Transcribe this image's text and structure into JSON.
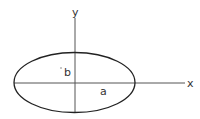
{
  "diagram": {
    "type": "ellipse-axes",
    "axes": {
      "x_label": "x",
      "y_label": "y"
    },
    "ellipse": {
      "semi_major_label": "a",
      "semi_minor_label": "b"
    },
    "colors": {
      "stroke": "#222222",
      "axis": "#555555",
      "text": "#333333",
      "background": "#ffffff"
    }
  }
}
